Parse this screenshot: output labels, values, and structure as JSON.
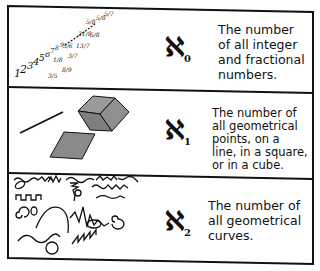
{
  "rows": [
    {
      "symbol": "ℵ",
      "subscript": "0",
      "description": "The number\nof all integer\nand fractional\nnumbers.",
      "illustration": "integers-and-fractions"
    },
    {
      "symbol": "ℵ",
      "subscript": "1",
      "description": "The number of\nall geometrical\npoints, on a\nline, in a square,\nor in a cube.",
      "illustration": "line-square-cube"
    },
    {
      "symbol": "ℵ",
      "subscript": "2",
      "description": "The number of\nall geometrical\ncurves.",
      "illustration": "assorted-curves"
    }
  ],
  "integers": [
    "1",
    "2",
    "3",
    "4",
    "5",
    "6",
    "7",
    "8",
    "9"
  ],
  "fractions": [
    "3/5",
    "1/8",
    "8/9",
    "5/6",
    "3/7",
    "13/7",
    "31/8",
    "5/8",
    "5/8",
    "5/7"
  ]
}
